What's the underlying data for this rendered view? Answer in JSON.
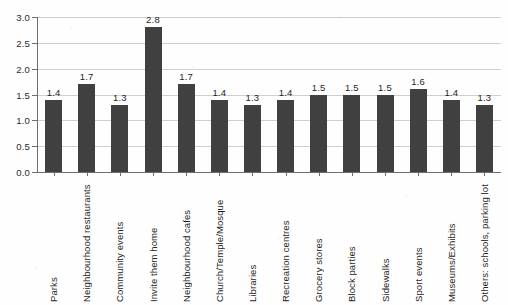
{
  "chart_data": {
    "type": "bar",
    "title": "",
    "subtitle": "",
    "xlabel": "",
    "ylabel": "",
    "ylim": [
      0.0,
      3.0
    ],
    "grid": true,
    "legend": false,
    "orientation": "vertical",
    "bar_color": "#404040",
    "background_color": "#fefefe",
    "gridline_color": "#cfcfcf",
    "axis_color": "#6e6e6e",
    "ytick_labels": [
      "3.0",
      "2.5",
      "2.0",
      "1.5",
      "1.0",
      "0.5",
      "0.0"
    ],
    "ytick_values": [
      3.0,
      2.5,
      2.0,
      1.5,
      1.0,
      0.5,
      0.0
    ],
    "categories": [
      "Parks",
      "Neighbourhood restaurants",
      "Community events",
      "Invite them home",
      "Neighbourhood cafes",
      "Church/Temple/Mosque",
      "Libraries",
      "Recreation centres",
      "Grocery stores",
      "Block parties",
      "Sidewalks",
      "Sport events",
      "Museums/Exhibits",
      "Others: schools, parking lot"
    ],
    "values": [
      1.4,
      1.7,
      1.3,
      2.8,
      1.7,
      1.4,
      1.3,
      1.4,
      1.5,
      1.5,
      1.5,
      1.6,
      1.4,
      1.3
    ],
    "value_labels": [
      "1.4",
      "1.7",
      "1.3",
      "2.8",
      "1.7",
      "1.4",
      "1.3",
      "1.4",
      "1.5",
      "1.5",
      "1.5",
      "1.6",
      "1.4",
      "1.3"
    ]
  }
}
